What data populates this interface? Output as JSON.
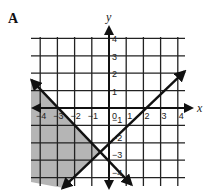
{
  "panel": {
    "label": "A"
  },
  "chart_data": {
    "type": "line",
    "title": "",
    "xlabel": "x",
    "ylabel": "y",
    "xlim": [
      -4.6,
      4.4
    ],
    "ylim": [
      -4.6,
      4.2
    ],
    "grid": true,
    "x_ticks": [
      -4,
      -3,
      -2,
      -1,
      0,
      1,
      2,
      3,
      4
    ],
    "y_ticks": [
      4,
      3,
      2,
      1,
      -1,
      -2,
      -3,
      -4
    ],
    "x_tick_labels": [
      "−4",
      "−3",
      "−2",
      "−1",
      "0",
      "1",
      "2",
      "3",
      "4"
    ],
    "y_tick_labels": [
      "4",
      "3",
      "2",
      "1",
      "−1",
      "−2",
      "−3",
      "−4"
    ],
    "series": [
      {
        "name": "rising line",
        "equation": "y = x - 2",
        "style": "solid",
        "arrows": "both",
        "x": [
          -2.7,
          4.4
        ],
        "y": [
          -4.6,
          2.1
        ]
      },
      {
        "name": "falling line",
        "equation": "y = -x - 3",
        "style": "solid",
        "arrows": "both",
        "x": [
          -4.5,
          1.3
        ],
        "y": [
          1.6,
          -4.4
        ]
      }
    ],
    "shaded_region": {
      "description": "region left of both lines (y < -x - 3 and y > x - 2)",
      "color": "#a8a8a8"
    },
    "intersection": {
      "x": -0.5,
      "y": -2.5
    }
  }
}
